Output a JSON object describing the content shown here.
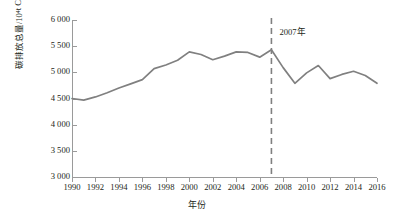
{
  "chart_data": {
    "type": "line",
    "title": "",
    "xlabel": "年份",
    "ylabel": "碳排放总量/10⁴ t CO₂当量",
    "ylabel_parts": {
      "pre": "碳排放总量/10",
      "sup": "4",
      "mid": " t CO",
      "sub": "2",
      "post": "当量"
    },
    "xlim": [
      1990,
      2016
    ],
    "ylim": [
      3000,
      6000
    ],
    "ytick_values": [
      6000,
      5500,
      5000,
      4500,
      4000,
      3500,
      3000
    ],
    "ytick_labels": [
      "6 000",
      "5 500",
      "5 000",
      "4 500",
      "4 000",
      "3 500",
      "3 000"
    ],
    "xtick_values": [
      1990,
      1992,
      1994,
      1996,
      1998,
      2000,
      2002,
      2004,
      2006,
      2008,
      2010,
      2012,
      2014,
      2016
    ],
    "xtick_labels": [
      "1990",
      "1992",
      "1994",
      "1996",
      "1998",
      "2000",
      "2002",
      "2004",
      "2006",
      "2008",
      "2010",
      "2012",
      "2014",
      "2016"
    ],
    "grid": false,
    "legend": null,
    "series": [
      {
        "name": "碳排放总量",
        "color": "#808080",
        "x": [
          1990,
          1991,
          1992,
          1993,
          1994,
          1995,
          1996,
          1997,
          1998,
          1999,
          2000,
          2001,
          2002,
          2003,
          2004,
          2005,
          2006,
          2007,
          2008,
          2009,
          2010,
          2011,
          2012,
          2013,
          2014,
          2015,
          2016
        ],
        "values": [
          4500,
          4470,
          4530,
          4610,
          4700,
          4780,
          4860,
          5070,
          5140,
          5230,
          5390,
          5340,
          5240,
          5310,
          5390,
          5380,
          5290,
          5430,
          5090,
          4790,
          4990,
          5130,
          4880,
          4960,
          5020,
          4940,
          4790
        ]
      }
    ],
    "annotations": [
      {
        "name": "2007-marker",
        "label": "2007年",
        "x": 2007,
        "type": "vertical-dashed-line",
        "color": "#808080"
      }
    ]
  }
}
